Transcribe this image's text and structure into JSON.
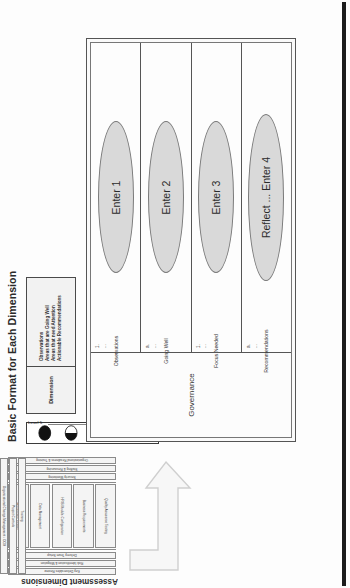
{
  "slide": {
    "title": "Basic Format for Each Dimension",
    "header_box": {
      "dimension_label": "Dimension",
      "observation_lines": [
        "Observations",
        "Areas that are Going Well",
        "Areas that need Attention",
        "Actionable Recommendations"
      ]
    },
    "legend": {
      "high_label": "Level 5",
      "low_label": "Level 1",
      "balls": [
        "full",
        "three-quarter",
        "half",
        "quarter",
        "empty"
      ]
    },
    "matrix": {
      "dimension_cell": "Governance",
      "rows": [
        {
          "label": "Observations",
          "bullets": [
            "1.",
            "..."
          ],
          "ellipse": "Enter 1"
        },
        {
          "label": "Going Well",
          "bullets": [
            "a.",
            "..."
          ],
          "ellipse": "Enter 2"
        },
        {
          "label": "Focus Needed",
          "bullets": [
            "1.",
            "..."
          ],
          "ellipse": "Enter 3"
        },
        {
          "label": "Recommendations",
          "bullets": [
            "a.",
            "..."
          ],
          "ellipse": "Reflect ... Enter 4"
        }
      ]
    }
  },
  "assessment": {
    "title": "Assessment Dimensions",
    "top_bars": [
      "Key Deliverables Review",
      "Risk Identification & Mitigation",
      "Delivery Team Setup"
    ],
    "columns": [
      "Quality Assurance Testing",
      "Business Requirements",
      "HRIS Module Configuration",
      "Data Management",
      "Architecture Design"
    ],
    "bottom_bars": [
      "Security Monitoring",
      "Staffing & Resourcing",
      "Organizational Readiness & Training"
    ],
    "side_columns": [
      "Training",
      "Project Controls",
      "Organizational Change Management / OCM"
    ]
  },
  "colors": {
    "ellipse_fill": "#d9d9d9",
    "ball_fill": "#111111",
    "border": "#555555",
    "panel": "#f2f2f2"
  }
}
